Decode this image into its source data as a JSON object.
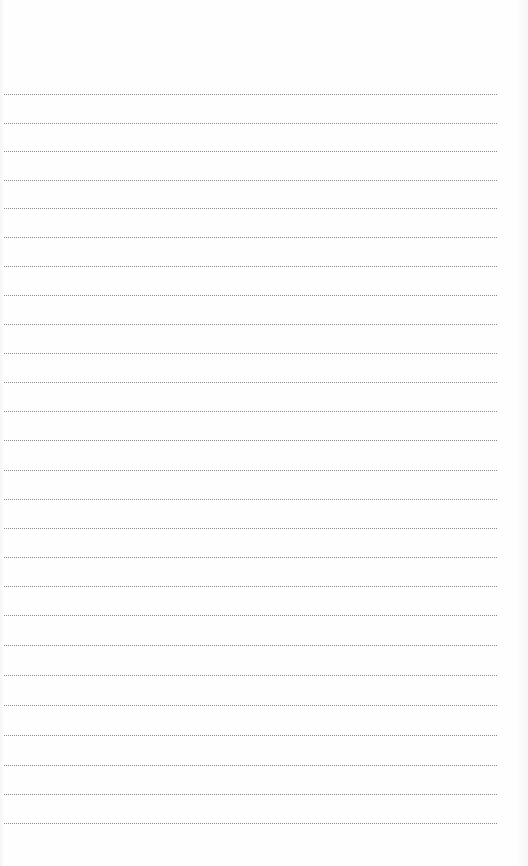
{
  "page": {
    "type": "lined-notepad-page",
    "background_color": "#fefefe",
    "rule_color": "#8a8a8a",
    "rule_style": "dotted",
    "rule_left": 4,
    "rule_right": 497,
    "rule_positions": [
      94,
      123,
      151,
      180,
      208,
      237,
      266,
      295,
      324,
      353,
      382,
      411,
      440,
      470,
      499,
      528,
      557,
      586,
      615,
      645,
      675,
      705,
      735,
      765,
      794,
      823
    ],
    "text_lines": []
  }
}
